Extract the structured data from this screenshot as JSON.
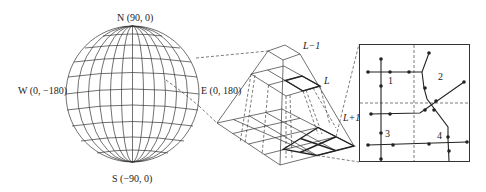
{
  "globe": {
    "north_label": "N (90, 0)",
    "south_label": "S (−90, 0)",
    "west_label": "W (0, −180)",
    "east_label": "E (0, 180)"
  },
  "pyramid": {
    "levels": [
      {
        "label": "L−1",
        "grid": "1x1"
      },
      {
        "label": "L",
        "grid": "2x2"
      },
      {
        "label": "L+1",
        "grid": "4x4"
      }
    ]
  },
  "tile_detail": {
    "region_labels": [
      "1",
      "2",
      "3",
      "4"
    ]
  },
  "colors": {
    "line": "#222222",
    "background": "#ffffff"
  }
}
